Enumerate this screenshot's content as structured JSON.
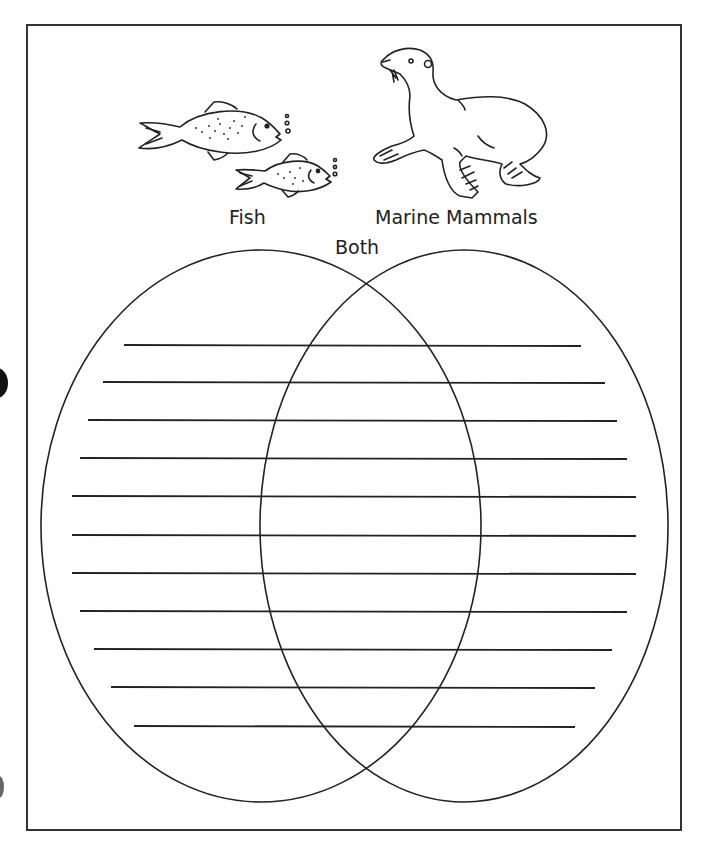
{
  "worksheet": {
    "labels": {
      "left_circle": "Fish",
      "right_circle": "Marine Mammals",
      "overlap": "Both"
    },
    "illustrations": [
      {
        "name": "fish-illustration",
        "description": "two fish blowing bubbles"
      },
      {
        "name": "sea-lion-illustration",
        "description": "sea lion"
      }
    ],
    "venn": {
      "left_ellipse": {
        "cx": 261,
        "cy": 526,
        "rx": 220,
        "ry": 276
      },
      "right_ellipse": {
        "cx": 464,
        "cy": 526,
        "rx": 204,
        "ry": 276
      }
    },
    "writing_lines": [
      {
        "y": 345,
        "x1": 124,
        "x2": 581
      },
      {
        "y": 382,
        "x1": 103,
        "x2": 605
      },
      {
        "y": 420,
        "x1": 88,
        "x2": 617
      },
      {
        "y": 458,
        "x1": 80,
        "x2": 627
      },
      {
        "y": 496,
        "x1": 72,
        "x2": 636
      },
      {
        "y": 535,
        "x1": 72,
        "x2": 636
      },
      {
        "y": 573,
        "x1": 72,
        "x2": 636
      },
      {
        "y": 611,
        "x1": 80,
        "x2": 627
      },
      {
        "y": 649,
        "x1": 94,
        "x2": 612
      },
      {
        "y": 687,
        "x1": 111,
        "x2": 595
      },
      {
        "y": 726,
        "x1": 134,
        "x2": 575
      }
    ],
    "colors": {
      "ink": "#222222",
      "paper": "#ffffff"
    }
  }
}
